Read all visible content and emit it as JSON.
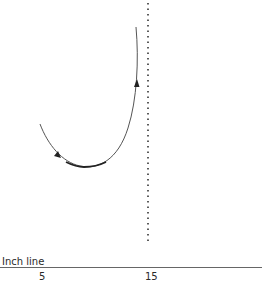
{
  "diagram": {
    "axis": {
      "label": "Inch line",
      "ticks": [
        {
          "label": "5"
        },
        {
          "label": "15"
        }
      ]
    },
    "curve": {
      "description": "U-shaped path with two direction arrows, descending from left then ascending on right",
      "arrows": 2,
      "color": "#333333"
    },
    "reference_line": {
      "style": "dotted",
      "orientation": "vertical",
      "position_tick": "15",
      "color": "#333333"
    }
  }
}
